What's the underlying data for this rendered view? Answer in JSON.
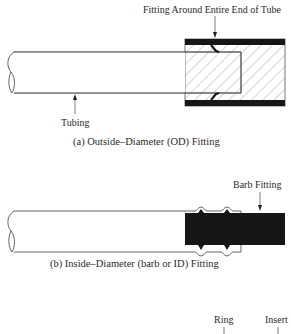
{
  "figure": {
    "panel_a": {
      "callout_label": "Fitting Around Entire End of Tube",
      "tubing_label": "Tubing",
      "caption": "(a) Outside–Diameter (OD) Fitting"
    },
    "panel_b": {
      "callout_label": "Barb Fitting",
      "caption": "(b) Inside–Diameter (barb or ID) Fitting"
    },
    "panel_c": {
      "ring_label": "Ring",
      "insert_label": "Insert"
    },
    "colors": {
      "line": "#555555",
      "fill_dark": "#161616",
      "hatch": "#999999"
    }
  }
}
